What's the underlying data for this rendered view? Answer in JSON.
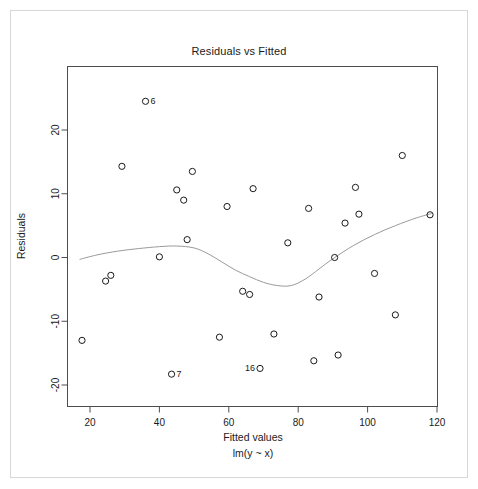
{
  "chart_data": {
    "type": "scatter",
    "title": "Residuals vs Fitted",
    "xlabel": "Fitted values",
    "sublabel": "lm(y ~ x)",
    "ylabel": "Residuals",
    "xlim": [
      16,
      120
    ],
    "ylim": [
      -22.5,
      26.5
    ],
    "xticks": [
      20,
      40,
      60,
      80,
      100,
      120
    ],
    "yticks": [
      20,
      10,
      0,
      -10,
      -20
    ],
    "grid": false,
    "legend": null,
    "marker": "open-circle",
    "points": [
      {
        "x": 17.7,
        "y": -13.0,
        "label": null
      },
      {
        "x": 24.5,
        "y": -3.7,
        "label": null
      },
      {
        "x": 26.0,
        "y": -2.8,
        "label": null
      },
      {
        "x": 29.2,
        "y": 14.3,
        "label": null
      },
      {
        "x": 36.0,
        "y": 24.5,
        "label": "6"
      },
      {
        "x": 40.0,
        "y": 0.1,
        "label": null
      },
      {
        "x": 43.5,
        "y": -18.3,
        "label": "7"
      },
      {
        "x": 45.0,
        "y": 10.6,
        "label": null
      },
      {
        "x": 47.0,
        "y": 9.0,
        "label": null
      },
      {
        "x": 48.0,
        "y": 2.8,
        "label": null
      },
      {
        "x": 49.5,
        "y": 13.5,
        "label": null
      },
      {
        "x": 57.3,
        "y": -12.5,
        "label": null
      },
      {
        "x": 59.5,
        "y": 8.0,
        "label": null
      },
      {
        "x": 64.0,
        "y": -5.3,
        "label": null
      },
      {
        "x": 66.0,
        "y": -5.8,
        "label": null
      },
      {
        "x": 67.0,
        "y": 10.8,
        "label": null
      },
      {
        "x": 69.0,
        "y": -17.4,
        "label": "16"
      },
      {
        "x": 73.0,
        "y": -12.0,
        "label": null
      },
      {
        "x": 77.0,
        "y": 2.3,
        "label": null
      },
      {
        "x": 83.0,
        "y": 7.7,
        "label": null
      },
      {
        "x": 84.5,
        "y": -16.2,
        "label": null
      },
      {
        "x": 86.0,
        "y": -6.2,
        "label": null
      },
      {
        "x": 90.5,
        "y": 0.0,
        "label": null
      },
      {
        "x": 91.5,
        "y": -15.3,
        "label": null
      },
      {
        "x": 93.5,
        "y": 5.4,
        "label": null
      },
      {
        "x": 96.5,
        "y": 11.0,
        "label": null
      },
      {
        "x": 97.5,
        "y": 6.8,
        "label": null
      },
      {
        "x": 102.0,
        "y": -2.5,
        "label": null
      },
      {
        "x": 108.0,
        "y": -9.0,
        "label": null
      },
      {
        "x": 110.0,
        "y": 16.0,
        "label": null
      },
      {
        "x": 118.0,
        "y": 6.7,
        "label": null
      }
    ],
    "smooth_curve": {
      "name": "lowess-smoother",
      "color": "#9a9a9a",
      "points": [
        {
          "x": 17.0,
          "y": -0.3
        },
        {
          "x": 22.0,
          "y": 0.4
        },
        {
          "x": 28.0,
          "y": 1.0
        },
        {
          "x": 34.0,
          "y": 1.4
        },
        {
          "x": 40.0,
          "y": 1.7
        },
        {
          "x": 45.0,
          "y": 1.8
        },
        {
          "x": 50.0,
          "y": 1.5
        },
        {
          "x": 54.0,
          "y": 0.6
        },
        {
          "x": 58.0,
          "y": -0.7
        },
        {
          "x": 62.0,
          "y": -2.0
        },
        {
          "x": 66.0,
          "y": -3.0
        },
        {
          "x": 70.0,
          "y": -3.9
        },
        {
          "x": 74.0,
          "y": -4.4
        },
        {
          "x": 78.0,
          "y": -4.4
        },
        {
          "x": 82.0,
          "y": -3.4
        },
        {
          "x": 86.0,
          "y": -1.8
        },
        {
          "x": 90.0,
          "y": -0.2
        },
        {
          "x": 96.0,
          "y": 1.9
        },
        {
          "x": 102.0,
          "y": 3.6
        },
        {
          "x": 108.0,
          "y": 5.0
        },
        {
          "x": 114.0,
          "y": 6.2
        },
        {
          "x": 118.5,
          "y": 6.9
        }
      ]
    }
  },
  "window": {
    "app": "R Graphics Device",
    "background": "#ffffff"
  },
  "colors": {
    "frame": "#4d4d4d",
    "point": "#1a1a1a",
    "smoother": "#9a9a9a",
    "page_border": "#d8d8d8"
  }
}
